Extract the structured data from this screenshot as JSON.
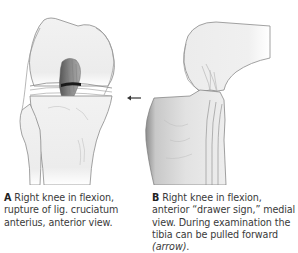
{
  "figure": {
    "panels": [
      {
        "id": "A",
        "letter": "A",
        "caption": "Right knee in flexion, rupture of lig. cruciatum anterius, anterior view.",
        "view": "anterior view",
        "structures": [
          "femur",
          "tibia",
          "fibula",
          "anterior cruciate ligament (ruptured)",
          "menisci"
        ]
      },
      {
        "id": "B",
        "letter": "B",
        "caption_main": "Right knee in flexion, anterior “drawer sign,” medial view. During examination the tibia can be pulled forward ",
        "caption_italic": "(arrow)",
        "caption_end": ".",
        "view": "medial view",
        "structures": [
          "femur",
          "tibia (displaced anteriorly)",
          "cruciate ligaments"
        ],
        "arrow": {
          "direction": "left",
          "meaning": "tibia pulled forward"
        }
      }
    ],
    "colors": {
      "bone_fill": "#eeeeee",
      "bone_outline": "#8a8a8a",
      "ligament": "#6e6e6e",
      "rupture_band": "#1a1a1a",
      "tibia_shadow": "#8c8c8c",
      "arrow": "#333333",
      "caption_text": "#3a3a3a"
    }
  }
}
